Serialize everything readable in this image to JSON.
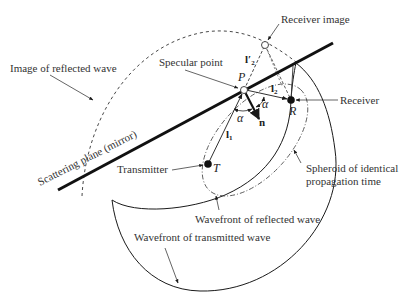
{
  "diagram": {
    "type": "geometric reflection diagram",
    "labels": {
      "receiver_image": "Receiver image",
      "image_of_reflected_wave": "Image of reflected wave",
      "specular_point": "Specular point",
      "receiver": "Receiver",
      "scattering_plane": "Scattering plane (mirror)",
      "transmitter": "Transmitter",
      "spheroid_line1": "Spheroid of identical",
      "spheroid_line2": "propagation time",
      "wavefront_reflected": "Wavefront of reflected wave",
      "wavefront_transmitted": "Wavefront of transmitted wave"
    },
    "symbols": {
      "P": "P",
      "R": "R",
      "T": "T",
      "n": "n",
      "alpha1": "α",
      "alpha2": "α",
      "l1": "l",
      "l1_sub": "1",
      "l2": "l",
      "l2_sub": "2",
      "l2p": "l′",
      "l2p_sub": "2"
    },
    "colors": {
      "line": "#1a1a1a",
      "text": "#333333"
    }
  }
}
